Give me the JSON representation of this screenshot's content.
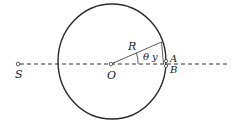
{
  "diagram": {
    "labels": {
      "source": "S",
      "center": "O",
      "radius": "R",
      "angle": "θ",
      "height": "y",
      "point_a": "A",
      "point_b": "B"
    },
    "colors": {
      "stroke": "#2a2a2a",
      "background": "#ffffff"
    }
  }
}
